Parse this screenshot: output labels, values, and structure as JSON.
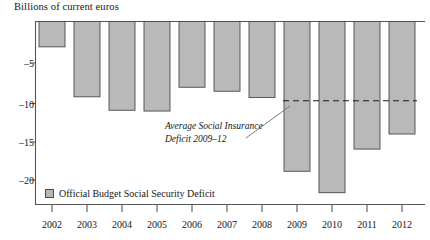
{
  "chart_data": {
    "type": "bar",
    "title": "",
    "ylabel": "Billions of current euros",
    "xlabel": "",
    "categories": [
      "2002",
      "2003",
      "2004",
      "2005",
      "2006",
      "2007",
      "2008",
      "2009",
      "2010",
      "2011",
      "2012"
    ],
    "values": [
      -3.2,
      -9.5,
      -11.2,
      -11.3,
      -8.3,
      -8.8,
      -9.6,
      -18.9,
      -21.6,
      -16.1,
      -14.2
    ],
    "series": [
      {
        "name": "Official Budget Social Security Deficit",
        "values": [
          -3.2,
          -9.5,
          -11.2,
          -11.3,
          -8.3,
          -8.8,
          -9.6,
          -18.9,
          -21.6,
          -16.1,
          -14.2
        ]
      }
    ],
    "ylim": [
      -22.5,
      0
    ],
    "yticks": [
      -5,
      -10,
      -15,
      -20
    ],
    "ytick_labels": [
      "–5",
      "–10",
      "–15",
      "–20"
    ],
    "grid": false,
    "legend_position": "bottom-left",
    "bar_color": "#b9b9b9",
    "bar_edge_color": "#4a4a4a",
    "reference_line": {
      "label": "Average Social Insurance Deficit 2009–12",
      "value": -10,
      "style": "dashed",
      "from_category": "2009",
      "to_category": "2012"
    },
    "annotations": [
      {
        "lines": [
          "Average Social Insurance",
          "Deficit 2009–12"
        ],
        "style": "italic",
        "has_leader_line": true
      }
    ]
  },
  "axis": {
    "y_title": "Billions of current euros",
    "y_tick_labels": [
      "–5",
      "–10",
      "–15",
      "–20"
    ],
    "x_tick_labels": [
      "2002",
      "2003",
      "2004",
      "2005",
      "2006",
      "2007",
      "2008",
      "2009",
      "2010",
      "2011",
      "2012"
    ]
  },
  "annotation": {
    "line1": "Average Social Insurance",
    "line2": "Deficit 2009–12"
  },
  "legend": {
    "label": "Official Budget Social Security Deficit"
  },
  "colors": {
    "bar_fill": "#b9b9b9",
    "bar_stroke": "#4a4a4a",
    "axis": "#555555",
    "text": "#161616"
  }
}
